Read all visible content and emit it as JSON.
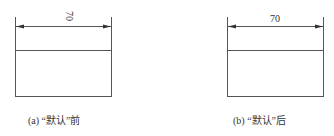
{
  "figures": [
    {
      "id": "a",
      "dimension_label": "70",
      "dimension_rotated": true,
      "caption": "(a) “默认”前"
    },
    {
      "id": "b",
      "dimension_label": "70",
      "dimension_rotated": false,
      "caption": "(b) “默认”后"
    }
  ],
  "colors": {
    "line": "#444444",
    "text": "#333333"
  }
}
